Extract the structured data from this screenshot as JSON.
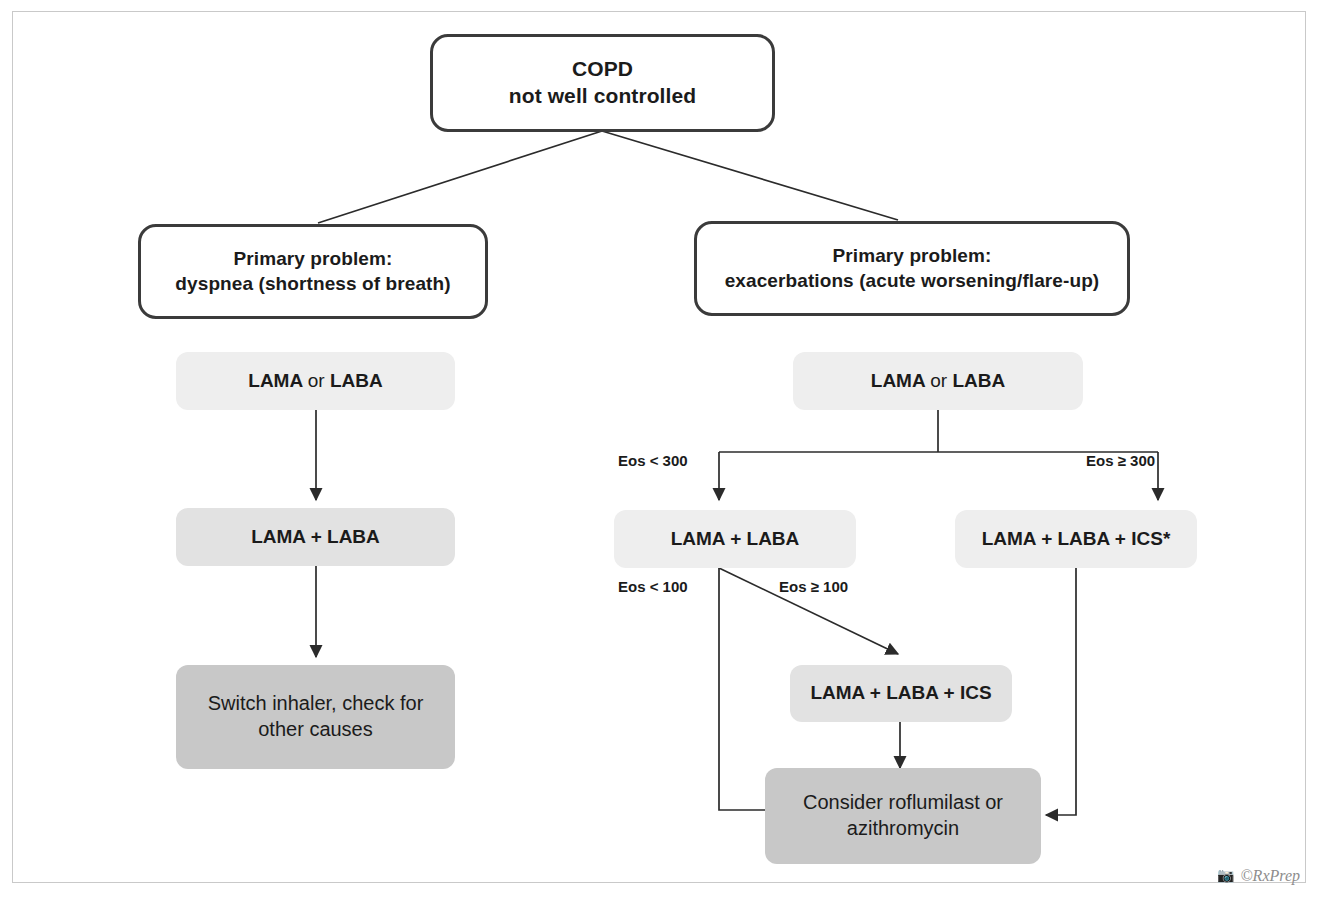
{
  "figure": {
    "credit": "©RxPrep",
    "credit_icon": "camera-icon"
  },
  "colors": {
    "outline_border": "#3b3b3b",
    "text": "#1b1b1b",
    "tint_light": "#eeeeee",
    "tint_medium": "#e2e2e2",
    "tint_dark": "#c8c8c8",
    "frame": "#c9c9c9",
    "connector": "#2b2b2b",
    "credit": "#8d8d8d"
  },
  "nodes": {
    "root": {
      "line1": "COPD",
      "line2": "not well controlled"
    },
    "branch_left": {
      "line1": "Primary problem:",
      "line2": "dyspnea (shortness of breath)"
    },
    "branch_right": {
      "line1": "Primary problem:",
      "line2": "exacerbations (acute worsening/flare-up)"
    },
    "left_step1": {
      "pre": "LAMA",
      "mid": "or",
      "post": "LABA"
    },
    "left_step2": {
      "text": "LAMA + LABA"
    },
    "left_step3": {
      "line1": "Switch inhaler, check for",
      "line2": "other causes"
    },
    "right_step1": {
      "pre": "LAMA",
      "mid": "or",
      "post": "LABA"
    },
    "right_low_eos": {
      "text": "LAMA + LABA"
    },
    "right_high_eos": {
      "text": "LAMA + LABA + ICS*"
    },
    "right_mid_ics": {
      "text": "LAMA + LABA + ICS"
    },
    "right_final": {
      "line1": "Consider roflumilast or",
      "line2": "azithromycin"
    }
  },
  "edge_labels": {
    "eos_lt_300": "Eos < 300",
    "eos_gte_300": "Eos ≥ 300",
    "eos_lt_100": "Eos < 100",
    "eos_gte_100": "Eos ≥ 100"
  }
}
